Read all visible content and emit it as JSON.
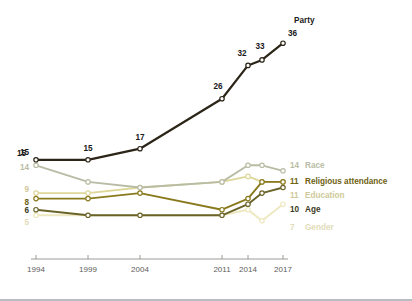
{
  "chart_data": {
    "type": "line",
    "title": "",
    "subtitle": "",
    "xlabel": "",
    "ylabel": "",
    "grid": false,
    "legend_position": "right-inline",
    "x": [
      1994,
      1999,
      2004,
      2011,
      2014,
      2015,
      2017
    ],
    "tick_labels": [
      "1994",
      "1999",
      "2004",
      "2011",
      "2014",
      "2017"
    ],
    "tick_values": [
      1994,
      1999,
      2004,
      2011,
      2014,
      2017
    ],
    "ylim": [
      0,
      40
    ],
    "xlim": [
      1994,
      2017
    ],
    "series": [
      {
        "name": "Party",
        "color": "#2b2517",
        "label_color": "#1a1a1a",
        "label_weight": "bold",
        "right_label": "Party",
        "right_value": "36",
        "left_value": "15",
        "values": [
          15,
          15,
          17,
          26,
          32,
          33,
          36
        ],
        "point_labels": [
          "15",
          "15",
          "17",
          "26",
          "32",
          "33",
          "36"
        ]
      },
      {
        "name": "Race",
        "color": "#b9bca4",
        "label_color": "#b9bca4",
        "label_weight": "bold",
        "right_label": "Race",
        "right_value": "14",
        "left_value": "14",
        "values": [
          14,
          11,
          10,
          11,
          14,
          14,
          13
        ],
        "point_labels": []
      },
      {
        "name": "Religious attendance",
        "color": "#8a7a1e",
        "label_color": "#6e6112",
        "label_weight": "bold",
        "right_label": "Religious attendance",
        "right_value": "11",
        "left_value": "8",
        "values": [
          8,
          8,
          9,
          6,
          8,
          11,
          11
        ],
        "point_labels": []
      },
      {
        "name": "Education",
        "color": "#ddd79a",
        "label_color": "#cfc99a",
        "label_weight": "bold",
        "right_label": "Education",
        "right_value": "11",
        "left_value": "9",
        "values": [
          9,
          9,
          10,
          11,
          12,
          11,
          11
        ],
        "point_labels": []
      },
      {
        "name": "Age",
        "color": "#6a6329",
        "label_color": "#3b3a20",
        "label_weight": "bold",
        "right_label": "Age",
        "right_value": "10",
        "left_value": "6",
        "values": [
          6,
          5,
          5,
          5,
          7,
          9,
          10
        ],
        "point_labels": []
      },
      {
        "name": "Gender",
        "color": "#eee8c0",
        "label_color": "#e2dcb8",
        "label_weight": "bold",
        "right_label": "Gender",
        "right_value": "7",
        "left_value": "5",
        "values": [
          5,
          5,
          5,
          5,
          6,
          4,
          7
        ],
        "point_labels": []
      }
    ]
  },
  "axis": {
    "tick_color": "#9a9a96",
    "tick_text_color": "#5d5d5a"
  }
}
